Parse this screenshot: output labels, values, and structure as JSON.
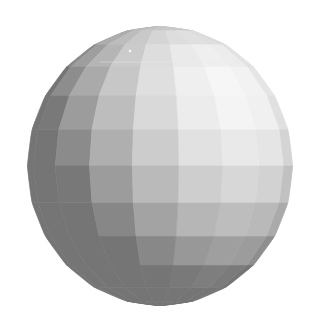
{
  "figure": {
    "title": "Flat-shaded faceted sphere",
    "background": "#ffffff",
    "sphere": {
      "center_x": 160,
      "center_y": 166,
      "radius_x": 133,
      "radius_y": 140,
      "longitude_segments": 18,
      "latitude_segments": 12,
      "rotation_deg": 8,
      "light_direction": [
        0.55,
        0.55,
        0.63
      ],
      "ambient": 0.26,
      "diffuse": 0.72,
      "min_gray": 70,
      "max_gray": 250,
      "edge_color": "#6a6a6a"
    },
    "highlight_dot": {
      "x": 130,
      "y": 51,
      "color": "#ffffff"
    },
    "scanline": {
      "y": 62,
      "x1": 100,
      "x2": 250,
      "color": "#e8e8e8"
    }
  }
}
